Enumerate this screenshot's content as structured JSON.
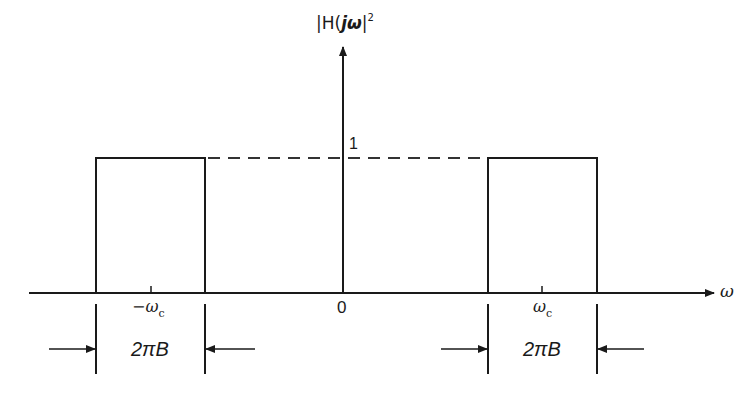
{
  "diagram": {
    "y_axis_label_prefix": "|H(",
    "y_axis_label_j": "jω",
    "y_axis_label_suffix": "|",
    "y_axis_label_exponent": "2",
    "x_axis_label": "ω",
    "level_label": "1",
    "origin_label": "0",
    "neg_center_label": "−ω",
    "neg_center_sub": "c",
    "pos_center_label": "ω",
    "pos_center_sub": "c",
    "left_bandwidth_label": "2πB",
    "right_bandwidth_label": "2πB",
    "colors": {
      "line": "#1a1a1a",
      "dashed": "#333333",
      "background": "#ffffff"
    }
  }
}
